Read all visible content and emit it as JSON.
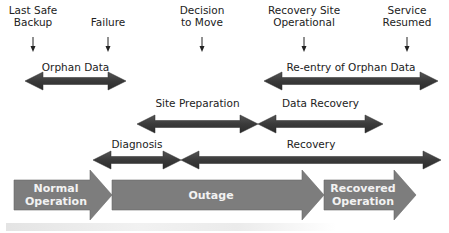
{
  "milestones": [
    {
      "label_lines": [
        "Last Safe",
        "Backup"
      ],
      "x": 33
    },
    {
      "label_lines": [
        "Failure"
      ],
      "x": 108
    },
    {
      "label_lines": [
        "Decision",
        "to Move"
      ],
      "x": 202
    },
    {
      "label_lines": [
        "Recovery Site",
        "Operational"
      ],
      "x": 304
    },
    {
      "label_lines": [
        "Service",
        "Resumed"
      ],
      "x": 407
    }
  ],
  "spans": [
    {
      "label": "Orphan Data",
      "x1": 25,
      "x2": 126,
      "y": 81,
      "label_y": 71,
      "left_head": true,
      "right_head": true
    },
    {
      "label": "Re-entry of Orphan Data",
      "x1": 264,
      "x2": 438,
      "y": 81,
      "label_y": 71,
      "left_head": true,
      "right_head": true
    },
    {
      "label": "Site Preparation",
      "x1": 137,
      "x2": 258,
      "y": 124,
      "label_y": 107,
      "left_head": true,
      "right_head": true
    },
    {
      "label": "Data Recovery",
      "x1": 258,
      "x2": 383,
      "y": 124,
      "label_y": 107,
      "left_head": true,
      "right_head": true
    },
    {
      "label": "Diagnosis",
      "x1": 93,
      "x2": 181,
      "y": 160,
      "label_y": 148,
      "left_head": true,
      "right_head": true
    },
    {
      "label": "Recovery",
      "x1": 181,
      "x2": 441,
      "y": 160,
      "label_y": 148,
      "left_head": true,
      "right_head": true
    }
  ],
  "phases": [
    {
      "label_lines": [
        "Normal",
        "Operation"
      ],
      "x1": 14,
      "x2": 112,
      "color": "#7d7d7d"
    },
    {
      "label_lines": [
        "Outage"
      ],
      "x1": 112,
      "x2": 324,
      "color": "#7d7d7d"
    },
    {
      "label_lines": [
        "Recovered",
        "Operation"
      ],
      "x1": 324,
      "x2": 416,
      "color": "#7d7d7d"
    }
  ],
  "caption": "",
  "colors": {
    "span_arrow": "#3c3c3c",
    "phase_arrow": "#7e7e7e",
    "phase_text": "#f4f4f4",
    "text": "#222222"
  }
}
